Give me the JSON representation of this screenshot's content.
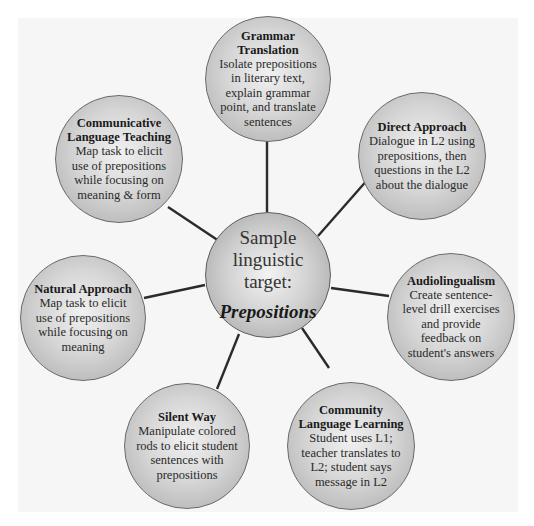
{
  "diagram": {
    "center": {
      "lines": [
        "Sample",
        "linguistic",
        "target:"
      ],
      "target": "Prepositions"
    },
    "nodes": [
      {
        "id": "grammar-translation",
        "title_lines": [
          "Grammar",
          "Translation"
        ],
        "desc_lines": [
          "Isolate prepositions",
          "in literary text,",
          "explain grammar",
          "point, and translate",
          "sentences"
        ]
      },
      {
        "id": "direct-approach",
        "title_lines": [
          "Direct Approach"
        ],
        "desc_lines": [
          "Dialogue in L2 using",
          "prepositions, then",
          "questions in the L2",
          "about the dialogue"
        ]
      },
      {
        "id": "audiolingualism",
        "title_lines": [
          "Audiolingualism"
        ],
        "desc_lines": [
          "Create sentence-",
          "level drill exercises",
          "and provide",
          "feedback on",
          "student's answers"
        ]
      },
      {
        "id": "community-language-learning",
        "title_lines": [
          "Community",
          "Language Learning"
        ],
        "desc_lines": [
          "Student uses L1;",
          "teacher translates to",
          "L2; student says",
          "message in L2"
        ]
      },
      {
        "id": "silent-way",
        "title_lines": [
          "Silent Way"
        ],
        "desc_lines": [
          "Manipulate colored",
          "rods to elicit student",
          "sentences with",
          "prepositions"
        ]
      },
      {
        "id": "natural-approach",
        "title_lines": [
          "Natural Approach"
        ],
        "desc_lines": [
          "Map task to elicit",
          "use of prepositions",
          "while focusing on",
          "meaning"
        ]
      },
      {
        "id": "communicative-language-teaching",
        "title_lines": [
          "Communicative",
          "Language Teaching"
        ],
        "desc_lines": [
          "Map task to elicit",
          "use of prepositions",
          "while focusing on",
          "meaning & form"
        ]
      }
    ]
  },
  "colors": {
    "background": "#ffffff",
    "panel": "#f6f6f6",
    "node_fill_light": "#f1f1f1",
    "node_fill_dark": "#a9a9a9",
    "node_border": "#6a6a6a",
    "connector": "#2b2b2b"
  }
}
